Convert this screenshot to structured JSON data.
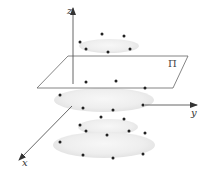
{
  "diagram": {
    "type": "3d-axes-with-plane-and-point-rings",
    "axes": {
      "z": {
        "label": "z",
        "from": [
          73,
          84
        ],
        "to": [
          73,
          8
        ],
        "label_pos": [
          67,
          14
        ]
      },
      "y": {
        "label": "y",
        "from": [
          145,
          105
        ],
        "to": [
          197,
          105
        ],
        "label_pos": [
          191,
          116
        ]
      },
      "x": {
        "label": "x",
        "from": [
          72,
          106
        ],
        "to": [
          19,
          160
        ],
        "label_pos": [
          22,
          166
        ]
      }
    },
    "plane": {
      "label": "Π",
      "points": "68,56 188,56 173,88 37,88",
      "label_pos": [
        168,
        67
      ]
    },
    "ellipses": [
      {
        "name": "top-ring",
        "cx": 109,
        "cy": 46,
        "rx": 30,
        "ry": 7
      },
      {
        "name": "middle-ring",
        "cx": 104,
        "cy": 100,
        "rx": 50,
        "ry": 12
      },
      {
        "name": "lower-ring",
        "cx": 108,
        "cy": 127,
        "rx": 30,
        "ry": 8
      },
      {
        "name": "bottom-ring",
        "cx": 104,
        "cy": 145,
        "rx": 51,
        "ry": 13
      }
    ],
    "points": [
      [
        80,
        42
      ],
      [
        86,
        49
      ],
      [
        102,
        34
      ],
      [
        124,
        36
      ],
      [
        108,
        52
      ],
      [
        130,
        49
      ],
      [
        86,
        82
      ],
      [
        116,
        81
      ],
      [
        145,
        88
      ],
      [
        60,
        95
      ],
      [
        83,
        108
      ],
      [
        113,
        110
      ],
      [
        143,
        105
      ],
      [
        101,
        117
      ],
      [
        124,
        119
      ],
      [
        80,
        125
      ],
      [
        86,
        131
      ],
      [
        107,
        135
      ],
      [
        129,
        131
      ],
      [
        145,
        133
      ],
      [
        60,
        142
      ],
      [
        83,
        155
      ],
      [
        113,
        158
      ],
      [
        143,
        154
      ]
    ],
    "colors": {
      "axis": "#555555",
      "plane": "#666666",
      "point": "#222222",
      "ellipse_fill": "#eeeeee"
    }
  }
}
